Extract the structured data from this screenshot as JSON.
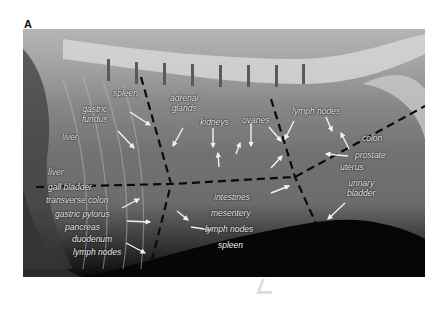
{
  "figure": {
    "panel_label": "A",
    "image_type": "lateral abdominal radiograph",
    "orientation_marker": "L",
    "labels": {
      "spleen_top": "spleen",
      "adrenal": "adrenal\nglands",
      "gastric_fundus": "gastric\nfundus",
      "kidneys": "kidneys",
      "ovaries": "ovaries",
      "lymph_nodes_top": "lymph nodes",
      "liver_upper": "liver",
      "colon": "colon",
      "prostate": "prostate",
      "uterus": "uterus",
      "urinary_bladder": "urinary\nbladder",
      "liver_lower": "liver",
      "gall_bladder": "gall bladder",
      "transverse_colon": "transverse colon",
      "gastric_pylorus": "gastric pylorus",
      "pancreas": "pancreas",
      "duodenum": "duodenum",
      "lymph_nodes_left": "lymph nodes",
      "intestines": "intestines",
      "mesentery": "mesentery",
      "lymph_nodes_mid": "lymph nodes",
      "spleen_bottom": "spleen"
    }
  }
}
